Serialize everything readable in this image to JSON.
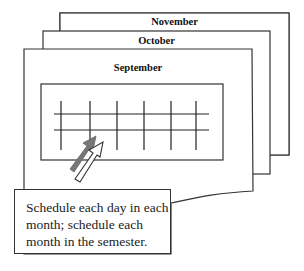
{
  "pages": [
    {
      "month": "November"
    },
    {
      "month": "October"
    },
    {
      "month": "September"
    }
  ],
  "calendar_grid": {
    "columns": 6,
    "rows": 2
  },
  "arrows": [
    {
      "style": "filled",
      "color": "#777777"
    },
    {
      "style": "outline",
      "color": "#ffffff"
    }
  ],
  "caption": {
    "lines": [
      "Schedule each day in each",
      "month; schedule each",
      "month in the semester."
    ]
  }
}
